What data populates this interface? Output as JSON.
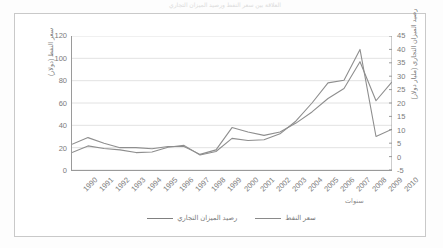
{
  "title": "العلاقة بين سعر النفط ورصيد الميزان التجاري",
  "axes": {
    "left_title": "سعر النفط (دولار)",
    "right_title": "رصيد الميزان التجاري (مليار دولار)",
    "x_title": "سنوات",
    "left_ticks": [
      "120",
      "100",
      "80",
      "60",
      "40",
      "20",
      "0"
    ],
    "right_ticks": [
      "45",
      "40",
      "35",
      "30",
      "25",
      "20",
      "15",
      "10",
      "5",
      "0",
      "-5"
    ]
  },
  "legend": {
    "items": [
      {
        "label": "رصيد الميزان التجاري",
        "color": "#808080"
      },
      {
        "label": "سعر النفط",
        "color": "#8a8a8a"
      }
    ]
  },
  "colors": {
    "line_trade": "#8e8e8e",
    "line_oil": "#8e8e8e",
    "grid": "#e2e2e2",
    "axis": "#9a9a9a",
    "text": "#7b7b7b",
    "frame": "#c9c9c9"
  },
  "chart_data": {
    "type": "line",
    "title": "العلاقة بين سعر النفط ورصيد الميزان التجاري",
    "xlabel": "سنوات",
    "ylabel": "سعر النفط (دولار)",
    "y2label": "رصيد الميزان التجاري (مليار دولار)",
    "grid": true,
    "legend_position": "bottom",
    "categories": [
      "1990",
      "1991",
      "1992",
      "1993",
      "1994",
      "1995",
      "1996",
      "1997",
      "1998",
      "1999",
      "2000",
      "2001",
      "2002",
      "2003",
      "2004",
      "2005",
      "2006",
      "2007",
      "2008",
      "2009",
      "2010"
    ],
    "ylim": [
      0,
      120
    ],
    "y2lim": [
      -5,
      45
    ],
    "yticks": [
      0,
      20,
      40,
      60,
      80,
      100,
      120
    ],
    "y2ticks": [
      -5,
      0,
      5,
      10,
      15,
      20,
      25,
      30,
      35,
      40,
      45
    ],
    "series": [
      {
        "name": "سعر النفط",
        "axis": "left",
        "values": [
          23,
          29,
          24,
          20,
          20,
          19,
          21,
          21,
          14,
          18,
          38,
          34,
          31,
          34,
          42,
          52,
          64,
          73,
          97,
          62,
          79
        ]
      },
      {
        "name": "رصيد الميزان التجاري",
        "axis": "right",
        "values": [
          1.5,
          4.0,
          3.0,
          2.5,
          1.5,
          1.7,
          3.5,
          4.2,
          0.6,
          1.9,
          6.8,
          6.0,
          6.3,
          8.5,
          13.3,
          20.0,
          27.5,
          28.5,
          40.0,
          7.5,
          10.2
        ]
      }
    ]
  }
}
